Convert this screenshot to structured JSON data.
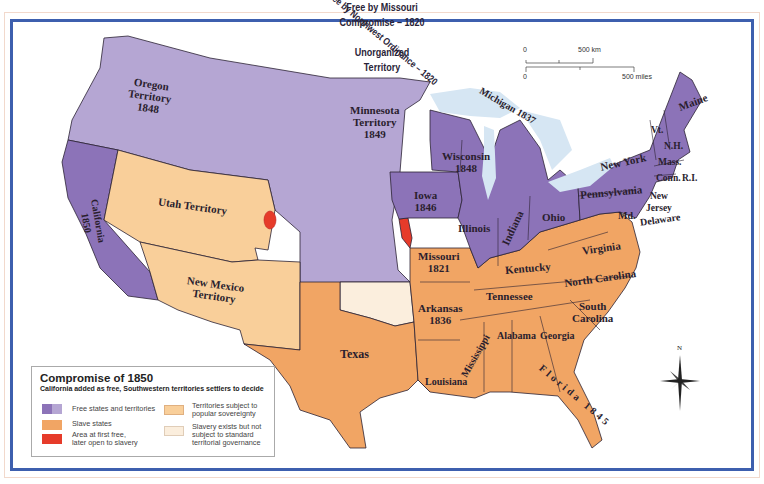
{
  "map": {
    "title": "Compromise of 1850",
    "subtitle": "California added as free, Southwestern territories settlers to decide",
    "colors": {
      "free": "#b5a6d3",
      "free_state": "#8c73b8",
      "slave": "#f1a564",
      "popular_sovereignty": "#f9cf9a",
      "unorganized": "#fbeedd",
      "opened": "#e63b2a",
      "water": "#d6e6f3",
      "frame": "#3d5fae",
      "border": "#2b2233"
    }
  },
  "legend": {
    "title": "Compromise of 1850",
    "subtitle": "California added as free, Southwestern territories settlers to decide",
    "items": [
      {
        "label_1": "Free states and territories",
        "label_2": "",
        "color": "#9b86c6"
      },
      {
        "label_1": "Slave states",
        "label_2": "",
        "color": "#f1a564"
      },
      {
        "label_1": "Area at first free,",
        "label_2": "later open to slavery",
        "color": "#e63b2a"
      },
      {
        "label_1": "Territories subject to",
        "label_2": "popular sovereignty",
        "color": "#f9cf9a"
      },
      {
        "label_1": "Slavery exists but not",
        "label_2": "subject to standard",
        "label_3": "territorial governance",
        "color": "#fbeedd"
      }
    ]
  },
  "scale_bar": {
    "km_zero": "0",
    "km_label": "500 km",
    "mi_zero": "0",
    "mi_label": "500 miles"
  },
  "compass": {
    "north_label": "N"
  },
  "labels": {
    "oregon": {
      "line1": "Oregon",
      "line2": "Territory",
      "line3": "1848"
    },
    "missouri_compromise": {
      "line1": "Free by Missouri",
      "line2": "Compromise – 1820"
    },
    "minnesota": {
      "line1": "Minnesota",
      "line2": "Territory",
      "line3": "1849"
    },
    "michigan": "Michigan 1837",
    "northwest_ordinance": "Free by Northwest Ordinance – 1820",
    "wisconsin": {
      "line1": "Wisconsin",
      "line2": "1848"
    },
    "iowa": {
      "line1": "Iowa",
      "line2": "1846"
    },
    "california": {
      "line1": "California",
      "line2": "1850"
    },
    "utah": "Utah Territory",
    "new_mexico": {
      "line1": "New Mexico",
      "line2": "Territory"
    },
    "unorganized": {
      "line1": "Unorganized",
      "line2": "Territory"
    },
    "texas": "Texas",
    "missouri": {
      "line1": "Missouri",
      "line2": "1821"
    },
    "arkansas": {
      "line1": "Arkansas",
      "line2": "1836"
    },
    "louisiana": "Louisiana",
    "mississippi": "Mississippi",
    "alabama": "Alabama",
    "georgia": "Georgia",
    "florida": "Florida 1845",
    "tennessee": "Tennessee",
    "kentucky": "Kentucky",
    "illinois": "Illinois",
    "indiana": "Indiana",
    "ohio": "Ohio",
    "virginia": "Virginia",
    "north_carolina": "North Carolina",
    "south_carolina": {
      "line1": "South",
      "line2": "Carolina"
    },
    "pennsylvania": "Pennsylvania",
    "new_york": "New York",
    "maryland": "Md.",
    "delaware": "Delaware",
    "new_jersey": {
      "line1": "New",
      "line2": "Jersey"
    },
    "vermont": "Vt.",
    "new_hampshire": "N.H.",
    "maine": "Maine",
    "massachusetts": "Mass.",
    "connecticut": "Conn.",
    "rhode_island": "R.I."
  }
}
